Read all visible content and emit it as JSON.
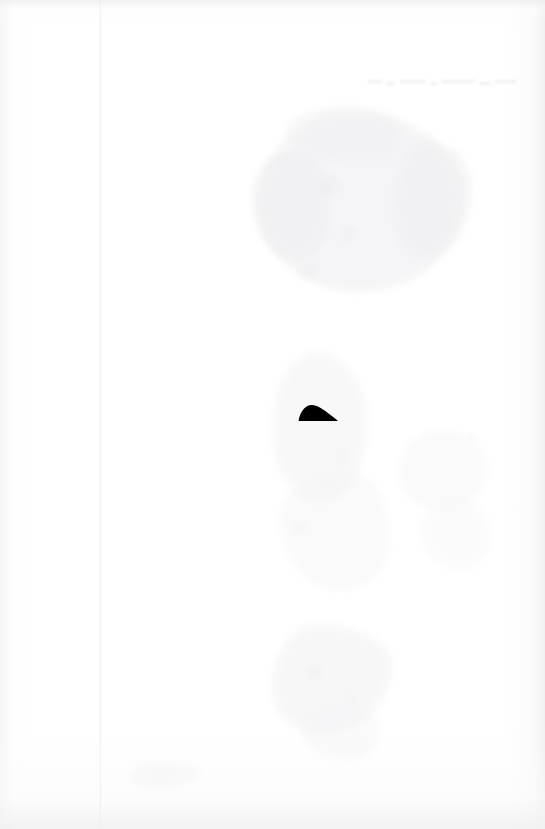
{
  "document": {
    "kind": "scanned-page",
    "page_width": 545,
    "page_height": 829,
    "background_color": "#ffffff",
    "description": "Near-blank scanned page with one small solid black dome-shaped mark near the center and very faint bleed-through ghosting",
    "visible_text": "",
    "legible_text_present": false
  },
  "colors": {
    "paper": "#ffffff",
    "ink": "#000000",
    "ghost_light": "#f2f2f3",
    "ghost_mid": "#ebebed",
    "ghost_dark": "#e4e4e6",
    "edge_band": "#efeff0",
    "fold_line": "#ececee"
  },
  "marks": {
    "primary": {
      "name": "black-dome-mark",
      "shape": "asymmetric-dome",
      "color": "#000000",
      "x": 298,
      "y": 404,
      "width": 40,
      "height": 18,
      "apex_x": 311,
      "apex_y": 405,
      "baseline_y": 421,
      "notes": "Steep rounded rise on the left, apex in the left third, long thin taper to a point on the right; flat bottom edge"
    }
  },
  "artifacts": {
    "fold_line": {
      "name": "vertical-fold-line",
      "x": 99,
      "opacity": 0.75
    },
    "top_edge_band": {
      "name": "top-scan-edge-band",
      "height": 14
    },
    "bottom_edge_band": {
      "name": "bottom-scan-edge-band",
      "height": 12
    },
    "ghost_text_line": {
      "name": "faint-illegible-text-line",
      "x": 368,
      "y": 76,
      "width": 150,
      "legible": false
    },
    "bleed_blobs": [
      {
        "name": "ghost-blob-upper-center",
        "x": 258,
        "y": 112,
        "width": 206,
        "height": 180,
        "color": "#f0f0f2",
        "opacity": 0.6
      },
      {
        "name": "ghost-blob-upper-left-lobe",
        "x": 252,
        "y": 150,
        "width": 78,
        "height": 110,
        "color": "#eeeef0",
        "opacity": 0.55
      },
      {
        "name": "ghost-blob-upper-right-lobe",
        "x": 392,
        "y": 140,
        "width": 80,
        "height": 120,
        "color": "#efeff1",
        "opacity": 0.5
      },
      {
        "name": "ghost-blob-upper-crown",
        "x": 286,
        "y": 106,
        "width": 120,
        "height": 60,
        "color": "#f1f1f3",
        "opacity": 0.5
      },
      {
        "name": "ghost-blob-mid-center",
        "x": 272,
        "y": 352,
        "width": 96,
        "height": 150,
        "color": "#f3f3f5",
        "opacity": 0.5
      },
      {
        "name": "ghost-blob-mid-lower",
        "x": 280,
        "y": 470,
        "width": 110,
        "height": 120,
        "color": "#f4f4f6",
        "opacity": 0.45
      },
      {
        "name": "ghost-blob-lower-center",
        "x": 272,
        "y": 624,
        "width": 120,
        "height": 110,
        "color": "#f1f1f3",
        "opacity": 0.5
      },
      {
        "name": "ghost-blob-lower-tail",
        "x": 300,
        "y": 700,
        "width": 80,
        "height": 60,
        "color": "#f4f4f6",
        "opacity": 0.45
      },
      {
        "name": "ghost-blob-right-mid",
        "x": 398,
        "y": 430,
        "width": 90,
        "height": 80,
        "color": "#f4f4f6",
        "opacity": 0.42
      },
      {
        "name": "ghost-blob-right-lower",
        "x": 420,
        "y": 500,
        "width": 70,
        "height": 70,
        "color": "#f5f5f7",
        "opacity": 0.38
      },
      {
        "name": "ghost-blob-bottom-left",
        "x": 130,
        "y": 762,
        "width": 70,
        "height": 26,
        "color": "#f3f3f5",
        "opacity": 0.45
      }
    ],
    "specks": [
      {
        "name": "ghost-speck-1",
        "x": 318,
        "y": 174,
        "size": 22,
        "color": "#ededef",
        "opacity": 0.55
      },
      {
        "name": "ghost-speck-2",
        "x": 340,
        "y": 226,
        "size": 16,
        "color": "#eeeef0",
        "opacity": 0.5
      },
      {
        "name": "ghost-speck-3",
        "x": 300,
        "y": 262,
        "size": 18,
        "color": "#efeff1",
        "opacity": 0.5
      },
      {
        "name": "ghost-speck-4",
        "x": 432,
        "y": 208,
        "size": 14,
        "color": "#f1f1f3",
        "opacity": 0.45
      },
      {
        "name": "ghost-speck-5",
        "x": 266,
        "y": 196,
        "size": 15,
        "color": "#f0f0f2",
        "opacity": 0.45
      },
      {
        "name": "ghost-speck-6",
        "x": 334,
        "y": 448,
        "size": 17,
        "color": "#f2f2f4",
        "opacity": 0.42
      },
      {
        "name": "ghost-speck-7",
        "x": 292,
        "y": 520,
        "size": 14,
        "color": "#f3f3f5",
        "opacity": 0.4
      },
      {
        "name": "ghost-speck-8",
        "x": 306,
        "y": 664,
        "size": 16,
        "color": "#f0f0f2",
        "opacity": 0.45
      },
      {
        "name": "ghost-speck-9",
        "x": 344,
        "y": 690,
        "size": 13,
        "color": "#f2f2f4",
        "opacity": 0.42
      },
      {
        "name": "ghost-speck-10",
        "x": 466,
        "y": 432,
        "size": 12,
        "color": "#f4f4f6",
        "opacity": 0.38
      }
    ]
  }
}
